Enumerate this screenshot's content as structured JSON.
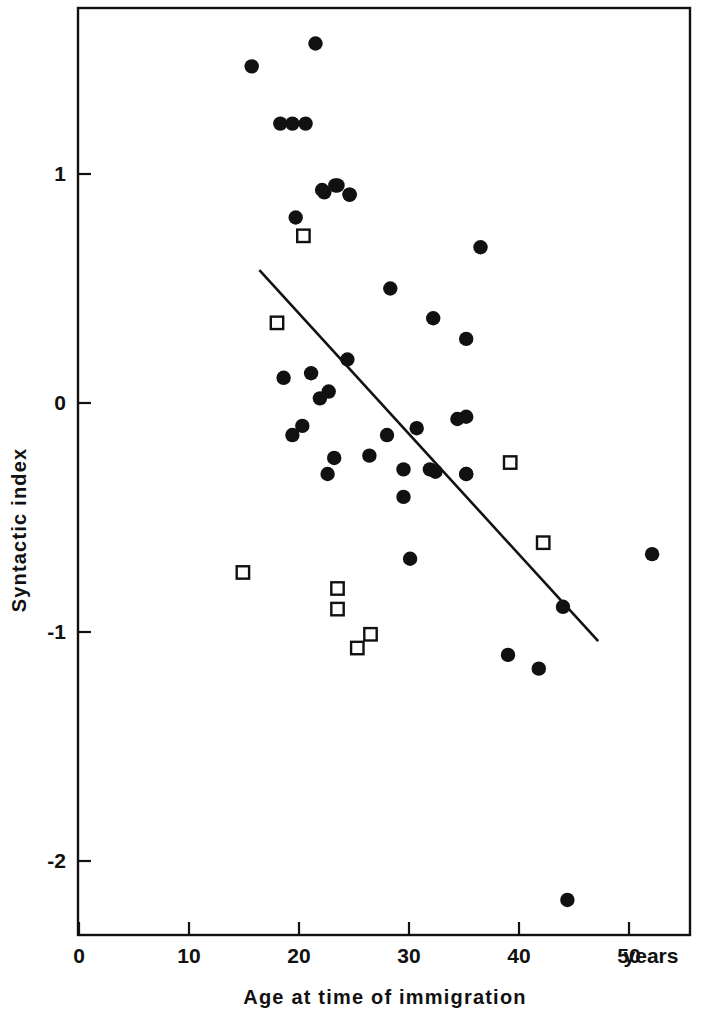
{
  "chart_data": {
    "type": "scatter",
    "title": "",
    "xlabel": "Age at time of immigration",
    "ylabel": "Syntactic index",
    "x_unit_label": "years",
    "xlim": [
      0,
      55.5
    ],
    "ylim": [
      -2.3,
      1.72
    ],
    "xticks": [
      0,
      10,
      20,
      30,
      40,
      50
    ],
    "xticklabels": [
      "0",
      "10",
      "20",
      "30",
      "40",
      "50"
    ],
    "yticks": [
      1,
      0,
      -1,
      -2
    ],
    "yticklabels": [
      "1",
      "0",
      "-1",
      "-2"
    ],
    "grid": false,
    "legend": false,
    "frame": true,
    "marker_colors": {
      "filled_circle": "#111111",
      "open_square": "#ffffff",
      "square_edge": "#111111",
      "regression_line": "#111111"
    },
    "series": [
      {
        "name": "filled-circle",
        "marker": "filled circle",
        "points": [
          [
            21.5,
            1.57
          ],
          [
            15.7,
            1.47
          ],
          [
            18.3,
            1.22
          ],
          [
            19.4,
            1.22
          ],
          [
            20.6,
            1.22
          ],
          [
            22.1,
            0.93
          ],
          [
            23.5,
            0.95
          ],
          [
            24.6,
            0.91
          ],
          [
            22.3,
            0.92
          ],
          [
            23.3,
            0.95
          ],
          [
            24.6,
            0.91
          ],
          [
            19.7,
            0.81
          ],
          [
            36.5,
            0.68
          ],
          [
            28.3,
            0.5
          ],
          [
            32.2,
            0.37
          ],
          [
            35.2,
            0.28
          ],
          [
            24.4,
            0.19
          ],
          [
            18.6,
            0.11
          ],
          [
            21.1,
            0.13
          ],
          [
            22.7,
            0.05
          ],
          [
            21.9,
            0.02
          ],
          [
            20.3,
            -0.1
          ],
          [
            19.4,
            -0.14
          ],
          [
            28.0,
            -0.14
          ],
          [
            30.7,
            -0.11
          ],
          [
            34.4,
            -0.07
          ],
          [
            32.4,
            -0.3
          ],
          [
            35.2,
            -0.06
          ],
          [
            23.2,
            -0.24
          ],
          [
            26.4,
            -0.23
          ],
          [
            22.6,
            -0.31
          ],
          [
            29.5,
            -0.29
          ],
          [
            31.9,
            -0.29
          ],
          [
            35.2,
            -0.31
          ],
          [
            29.5,
            -0.41
          ],
          [
            30.1,
            -0.68
          ],
          [
            35.2,
            -0.31
          ],
          [
            44.0,
            -0.89
          ],
          [
            39.0,
            -1.1
          ],
          [
            41.8,
            -1.16
          ],
          [
            52.1,
            -0.66
          ],
          [
            44.4,
            -2.17
          ]
        ]
      },
      {
        "name": "open-square",
        "marker": "open square",
        "points": [
          [
            20.4,
            0.73
          ],
          [
            18.0,
            0.35
          ],
          [
            14.9,
            -0.74
          ],
          [
            23.5,
            -0.81
          ],
          [
            23.5,
            -0.9
          ],
          [
            26.5,
            -1.01
          ],
          [
            25.3,
            -1.07
          ],
          [
            39.2,
            -0.26
          ],
          [
            42.2,
            -0.61
          ]
        ]
      }
    ],
    "regression_line": {
      "x0": 16.4,
      "y0": 0.58,
      "x1": 47.2,
      "y1": -1.04
    }
  },
  "axis": {
    "x_title": "Age at time of immigration",
    "y_title": "Syntactic index",
    "x_unit": "years"
  }
}
